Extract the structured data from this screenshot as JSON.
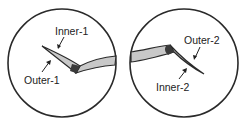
{
  "diagram": {
    "panels": [
      {
        "id": "panel-1",
        "labels": {
          "top": "Inner-1",
          "bottom": "Outer-1"
        }
      },
      {
        "id": "panel-2",
        "labels": {
          "top": "Outer-2",
          "bottom": "Inner-2"
        }
      }
    ],
    "colors": {
      "outline": "#2a2a2a",
      "shank_fill": "#c8c8c8",
      "heel_fill": "#3a3a3a",
      "background": "#ffffff"
    }
  }
}
